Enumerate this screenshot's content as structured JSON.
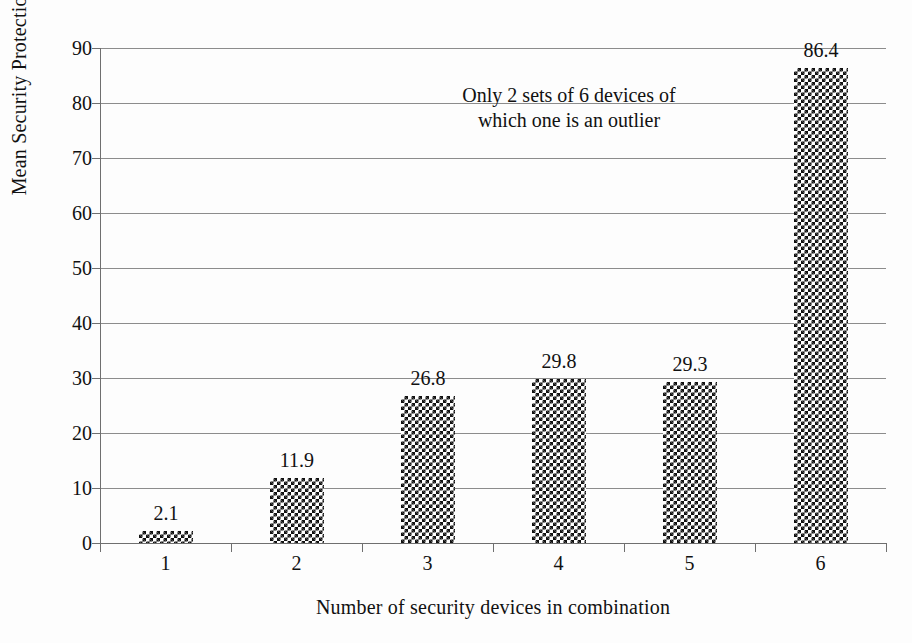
{
  "chart_data": {
    "type": "bar",
    "title": "",
    "xlabel": "Number of security devices in combination",
    "ylabel": "Mean Security Protection Factor",
    "categories": [
      "1",
      "2",
      "3",
      "4",
      "5",
      "6"
    ],
    "values": [
      2.1,
      11.9,
      26.8,
      29.8,
      29.3,
      86.4
    ],
    "value_labels": [
      "2.1",
      "11.9",
      "26.8",
      "29.8",
      "29.3",
      "86.4"
    ],
    "ylim": [
      0,
      90
    ],
    "yticks": [
      0,
      10,
      20,
      30,
      40,
      50,
      60,
      70,
      80,
      90
    ],
    "ytick_labels": [
      "0",
      "10",
      "20",
      "30",
      "40",
      "50",
      "60",
      "70",
      "80",
      "90"
    ],
    "grid": true,
    "legend": false,
    "legend_position": "none",
    "bar_fill": "checkerboard",
    "annotations": [
      {
        "name": "outlier-note",
        "lines": [
          "Only 2 sets of 6 devices of",
          "which one is an outlier"
        ],
        "x_category": "4",
        "y_value": 82
      }
    ],
    "colors": {
      "background": "#fdfdfd",
      "gridline": "#8c8c8c",
      "axis": "#6f6f6f",
      "text": "#111111",
      "bar_pattern_dark": "#111111",
      "bar_pattern_light": "#ffffff"
    }
  },
  "annotation_lines": {
    "line1": "Only 2 sets of 6 devices of",
    "line2": "which one is an outlier"
  }
}
